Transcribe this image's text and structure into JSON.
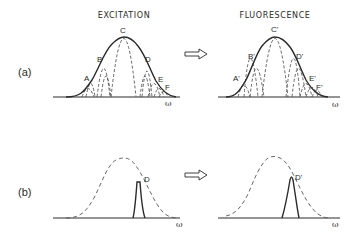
{
  "figure": {
    "titles": {
      "excitation": "EXCITATION",
      "fluorescence": "FLUORESCENCE"
    },
    "panels": [
      {
        "label": "(a)",
        "description": "Broad inhomogeneous excitation envelope made of many narrow homogeneous lines maps to broad fluorescence envelope",
        "excitation_points": [
          "A",
          "B",
          "C",
          "D",
          "E",
          "F"
        ],
        "fluorescence_points": [
          "A'",
          "B'",
          "C'",
          "D'",
          "E'",
          "F'"
        ]
      },
      {
        "label": "(b)",
        "description": "Narrow-band excitation at D selects subset; fluorescence is narrow line at D'",
        "excitation_point": "D",
        "fluorescence_point": "D'"
      }
    ],
    "axis_label": "ω",
    "arrow_symbol": "⇨",
    "colors": {
      "ink": "#2a2a2a",
      "dashed": "#555555",
      "background": "#ffffff"
    }
  }
}
